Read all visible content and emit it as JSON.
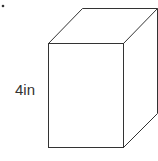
{
  "diagram": {
    "type": "rectangular-prism",
    "dimension_label": "4in",
    "bullet": "•",
    "stroke_color": "#333333",
    "background": "#ffffff"
  }
}
